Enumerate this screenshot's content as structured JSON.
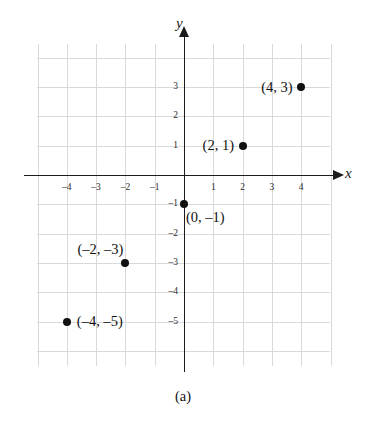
{
  "figure": {
    "caption": "(a)",
    "x_axis_name": "x",
    "y_axis_name": "y"
  },
  "chart_data": {
    "type": "scatter",
    "title": "",
    "subtitle": "",
    "xlabel": "x",
    "ylabel": "y",
    "xlim": [
      -5,
      5
    ],
    "ylim": [
      -6,
      4
    ],
    "grid": true,
    "legend": "none",
    "xticks": [
      -4,
      -3,
      -2,
      -1,
      1,
      2,
      3,
      4
    ],
    "yticks": [
      3,
      2,
      1,
      -1,
      -2,
      -3,
      -4,
      -5
    ],
    "xtick_labels": [
      "–4",
      "–3",
      "–2",
      "–1",
      "1",
      "2",
      "3",
      "4"
    ],
    "ytick_labels": [
      "3",
      "2",
      "1",
      "–1",
      "–2",
      "–3",
      "–4",
      "–5"
    ],
    "points": [
      {
        "x": 4,
        "y": 3,
        "label": "(4, 3)",
        "label_side": "left"
      },
      {
        "x": 2,
        "y": 1,
        "label": "(2, 1)",
        "label_side": "left"
      },
      {
        "x": 0,
        "y": -1,
        "label": "(0, –1)",
        "label_side": "below-right"
      },
      {
        "x": -2,
        "y": -3,
        "label": "(–2, –3)",
        "label_side": "above-left"
      },
      {
        "x": -4,
        "y": -5,
        "label": "(–4, –5)",
        "label_side": "right"
      }
    ],
    "colors": {
      "point": "#111111",
      "axis": "#1b1b1b",
      "grid": "#d9d9d9",
      "text": "#111111"
    }
  }
}
